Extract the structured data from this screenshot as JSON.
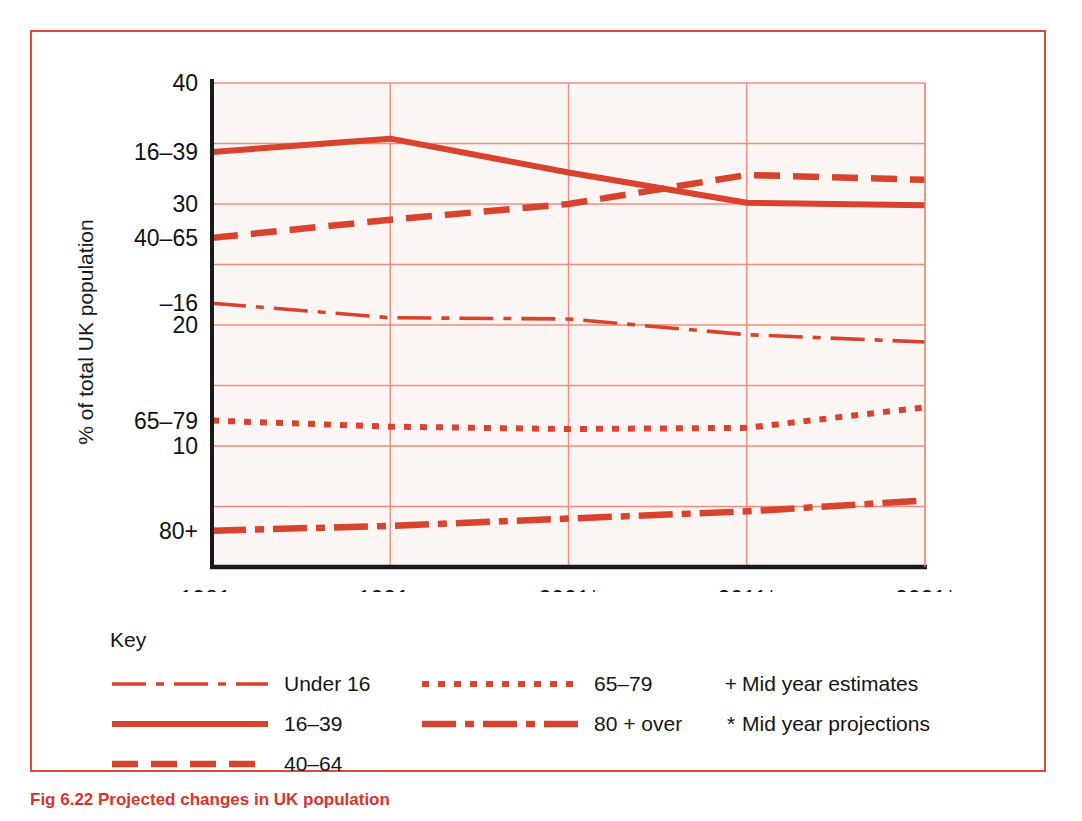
{
  "colors": {
    "line": "#d9432e",
    "grid": "#f08c80",
    "axis": "#1a1a1a",
    "frame": "#e8453c",
    "plot_bg": "#fbf6f4",
    "caption": "#d9332c"
  },
  "axis": {
    "ylabel": "% of total UK population",
    "ytick_labels": [
      "40",
      "30",
      "20",
      "10"
    ],
    "series_axis_labels": [
      "16–39",
      "40–65",
      "–16",
      "65–79",
      "80+"
    ],
    "xtick_labels": [
      "1981+",
      "1991+",
      "2001*",
      "2011*",
      "2021*"
    ]
  },
  "legend": {
    "title": "Key",
    "col1": [
      {
        "label": "Under 16",
        "style": "thin-dash-dot"
      },
      {
        "label": "16–39",
        "style": "solid"
      },
      {
        "label": "40–64",
        "style": "dashed"
      }
    ],
    "col2": [
      {
        "label": "65–79",
        "style": "dotted"
      },
      {
        "label": "80 + over",
        "style": "thick-dash-dot"
      }
    ],
    "col3": [
      {
        "symbol": "+",
        "note": "Mid year estimates"
      },
      {
        "symbol": "*",
        "note": "Mid year projections"
      }
    ]
  },
  "caption": "Fig 6.22  Projected changes in UK population",
  "chart_data": {
    "type": "line",
    "title": "",
    "xlabel": "",
    "ylabel": "% of total UK population",
    "categories": [
      "1981+",
      "1991+",
      "2001*",
      "2011*",
      "2021*"
    ],
    "ylim": [
      0,
      40
    ],
    "yticks": [
      0,
      5,
      10,
      15,
      20,
      25,
      30,
      35,
      40
    ],
    "ytick_labels_shown": [
      40,
      30,
      20,
      10
    ],
    "grid": true,
    "legend_position": "below",
    "series": [
      {
        "name": "Under 16",
        "style": "thin-dash-dot",
        "axis_label": "–16",
        "values": [
          21.8,
          20.6,
          20.5,
          19.2,
          18.6
        ]
      },
      {
        "name": "16–39",
        "style": "solid",
        "axis_label": "16–39",
        "values": [
          34.3,
          35.4,
          32.6,
          30.1,
          29.9
        ]
      },
      {
        "name": "40–64",
        "style": "dashed",
        "axis_label": "40–65",
        "values": [
          27.2,
          28.7,
          30.0,
          32.4,
          32.0
        ]
      },
      {
        "name": "65–79",
        "style": "dotted",
        "axis_label": "65–79",
        "values": [
          12.1,
          11.6,
          11.4,
          11.5,
          13.2
        ]
      },
      {
        "name": "80 + over",
        "style": "thick-dash-dot",
        "axis_label": "80+",
        "values": [
          3.0,
          3.4,
          4.0,
          4.6,
          5.5
        ]
      }
    ]
  }
}
